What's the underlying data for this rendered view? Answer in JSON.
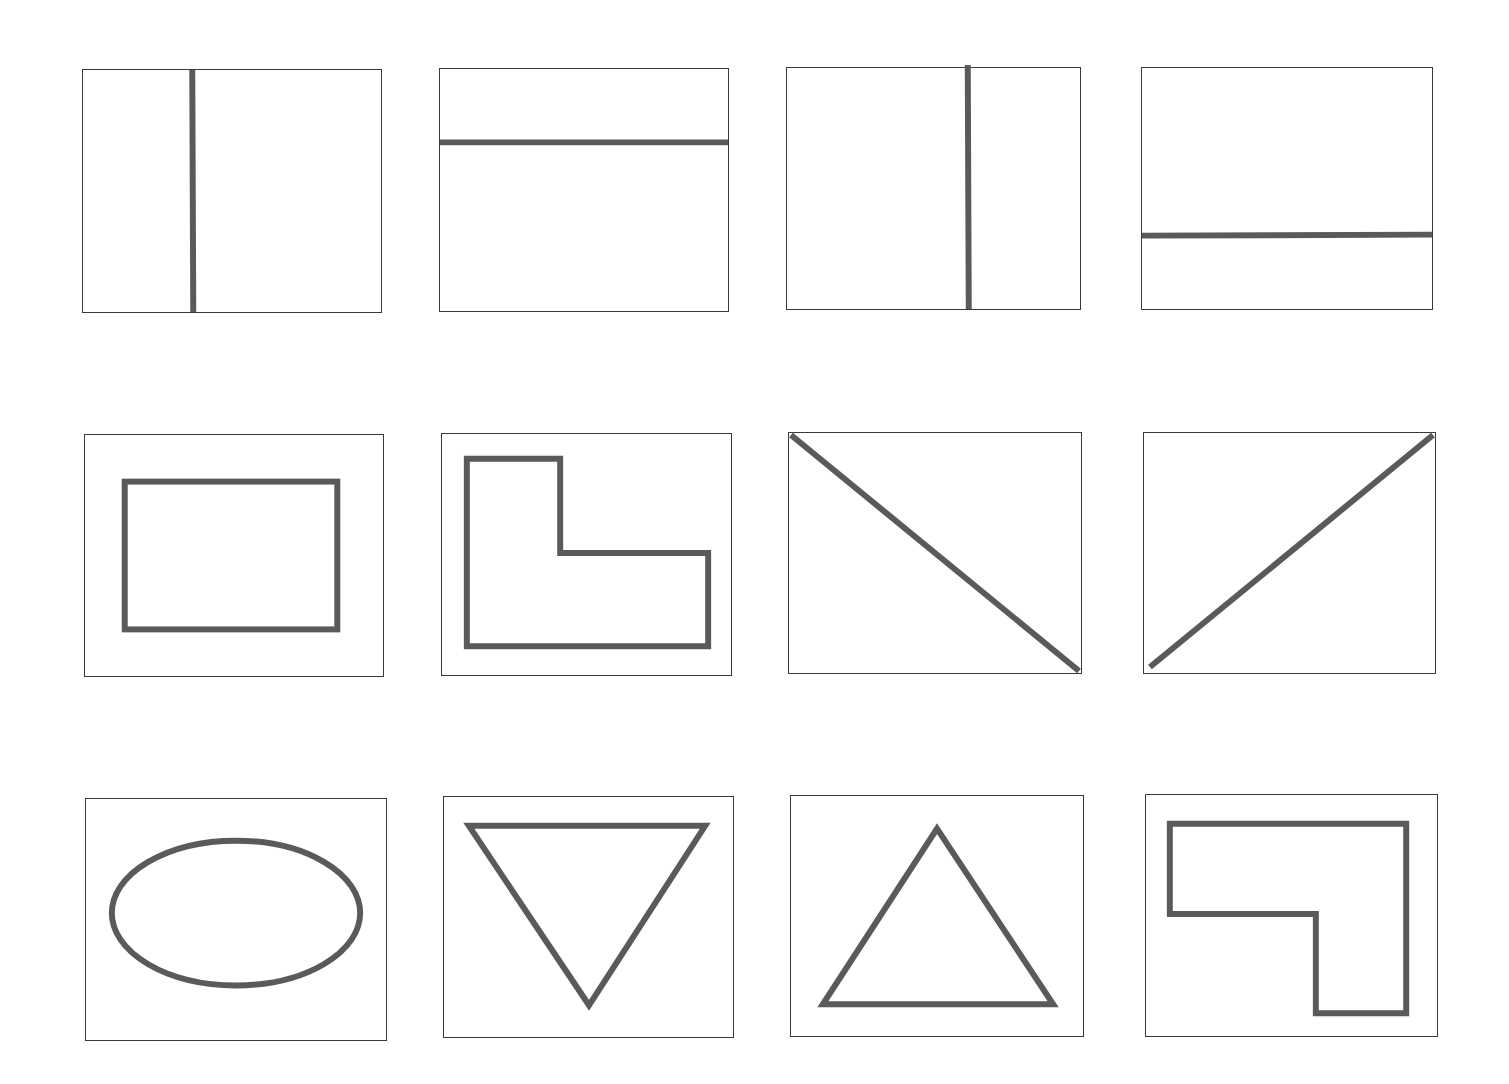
{
  "figure": {
    "layout": {
      "rows": 3,
      "columns": 4
    },
    "stroke_color": "#5a5a5a",
    "frame_color": "#3a3a3a",
    "panels": [
      {
        "id": 1,
        "row": 1,
        "col": 1,
        "shape": "vertical-line",
        "box": [
          82,
          69,
          300,
          244
        ]
      },
      {
        "id": 2,
        "row": 1,
        "col": 2,
        "shape": "horizontal-line",
        "box": [
          439,
          68,
          290,
          244
        ]
      },
      {
        "id": 3,
        "row": 1,
        "col": 3,
        "shape": "vertical-line",
        "box": [
          786,
          67,
          295,
          243
        ]
      },
      {
        "id": 4,
        "row": 1,
        "col": 4,
        "shape": "horizontal-line",
        "box": [
          1141,
          67,
          292,
          243
        ]
      },
      {
        "id": 5,
        "row": 2,
        "col": 1,
        "shape": "rectangle",
        "box": [
          84,
          434,
          300,
          243
        ]
      },
      {
        "id": 6,
        "row": 2,
        "col": 2,
        "shape": "l-shape",
        "box": [
          441,
          433,
          291,
          243
        ]
      },
      {
        "id": 7,
        "row": 2,
        "col": 3,
        "shape": "diagonal-line-descending",
        "box": [
          788,
          432,
          294,
          242
        ]
      },
      {
        "id": 8,
        "row": 2,
        "col": 4,
        "shape": "diagonal-line-ascending",
        "box": [
          1143,
          432,
          293,
          242
        ]
      },
      {
        "id": 9,
        "row": 3,
        "col": 1,
        "shape": "ellipse",
        "box": [
          85,
          798,
          302,
          243
        ]
      },
      {
        "id": 10,
        "row": 3,
        "col": 2,
        "shape": "inverted-triangle",
        "box": [
          443,
          796,
          291,
          242
        ]
      },
      {
        "id": 11,
        "row": 3,
        "col": 3,
        "shape": "triangle",
        "box": [
          790,
          795,
          294,
          242
        ]
      },
      {
        "id": 12,
        "row": 3,
        "col": 4,
        "shape": "mirrored-l-shape",
        "box": [
          1145,
          794,
          293,
          243
        ]
      }
    ]
  }
}
